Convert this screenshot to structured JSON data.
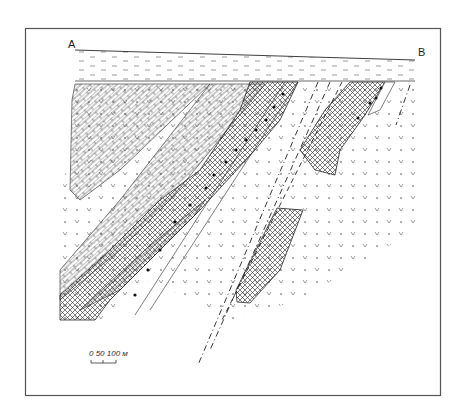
{
  "diagram": {
    "type": "geological-cross-section",
    "profile": {
      "start_label": "A",
      "end_label": "B"
    },
    "scale_bar": {
      "text": "0 50 100 м",
      "ticks": [
        "0",
        "50",
        "100"
      ],
      "unit": "м"
    },
    "colors": {
      "ink": "#2a2a2a",
      "frame": "#555555",
      "paper": "#ffffff"
    },
    "units": [
      {
        "id": "overburden",
        "pattern": "dashes"
      },
      {
        "id": "limestone",
        "pattern": "brick"
      },
      {
        "id": "ore-body",
        "pattern": "cross-hatch"
      },
      {
        "id": "volcanics",
        "pattern": "v-and-dots"
      },
      {
        "id": "conglomerate",
        "pattern": "black-dots"
      },
      {
        "id": "fault-zone",
        "pattern": "dash-dot"
      }
    ]
  }
}
